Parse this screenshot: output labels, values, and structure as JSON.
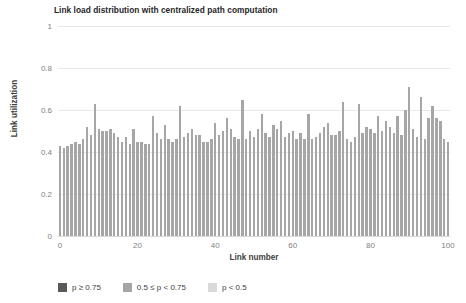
{
  "chart_data": {
    "type": "bar",
    "title": "Link load distribution with centralized path computation",
    "xlabel": "Link number",
    "ylabel": "Link utilization",
    "xlim": [
      0,
      101
    ],
    "ylim": [
      0,
      1
    ],
    "grid": true,
    "legend_position": "bottom-left",
    "bar_color": "#a6a6a6",
    "x_ticks": [
      0,
      20,
      40,
      60,
      80,
      100
    ],
    "y_ticks": [
      0,
      0.2,
      0.4,
      0.6,
      0.8,
      1
    ],
    "y_tick_labels": [
      "0",
      "0.2",
      "0.4",
      "0.6",
      "0.8",
      "1"
    ],
    "x": [
      0,
      1,
      2,
      3,
      4,
      5,
      6,
      7,
      8,
      9,
      10,
      11,
      12,
      13,
      14,
      15,
      16,
      17,
      18,
      19,
      20,
      21,
      22,
      23,
      24,
      25,
      26,
      27,
      28,
      29,
      30,
      31,
      32,
      33,
      34,
      35,
      36,
      37,
      38,
      39,
      40,
      41,
      42,
      43,
      44,
      45,
      46,
      47,
      48,
      49,
      50,
      51,
      52,
      53,
      54,
      55,
      56,
      57,
      58,
      59,
      60,
      61,
      62,
      63,
      64,
      65,
      66,
      67,
      68,
      69,
      70,
      71,
      72,
      73,
      74,
      75,
      76,
      77,
      78,
      79,
      80,
      81,
      82,
      83,
      84,
      85,
      86,
      87,
      88,
      89,
      90,
      91,
      92,
      93,
      94,
      95,
      96,
      97,
      98,
      99,
      100
    ],
    "categories": [
      "0",
      "1",
      "2",
      "3",
      "4",
      "5",
      "6",
      "7",
      "8",
      "9",
      "10",
      "11",
      "12",
      "13",
      "14",
      "15",
      "16",
      "17",
      "18",
      "19",
      "20",
      "21",
      "22",
      "23",
      "24",
      "25",
      "26",
      "27",
      "28",
      "29",
      "30",
      "31",
      "32",
      "33",
      "34",
      "35",
      "36",
      "37",
      "38",
      "39",
      "40",
      "41",
      "42",
      "43",
      "44",
      "45",
      "46",
      "47",
      "48",
      "49",
      "50",
      "51",
      "52",
      "53",
      "54",
      "55",
      "56",
      "57",
      "58",
      "59",
      "60",
      "61",
      "62",
      "63",
      "64",
      "65",
      "66",
      "67",
      "68",
      "69",
      "70",
      "71",
      "72",
      "73",
      "74",
      "75",
      "76",
      "77",
      "78",
      "79",
      "80",
      "81",
      "82",
      "83",
      "84",
      "85",
      "86",
      "87",
      "88",
      "89",
      "90",
      "91",
      "92",
      "93",
      "94",
      "95",
      "96",
      "97",
      "98",
      "99",
      "100"
    ],
    "values": [
      0.43,
      0.42,
      0.43,
      0.44,
      0.45,
      0.44,
      0.46,
      0.52,
      0.48,
      0.63,
      0.51,
      0.5,
      0.5,
      0.51,
      0.49,
      0.47,
      0.45,
      0.47,
      0.44,
      0.51,
      0.45,
      0.45,
      0.44,
      0.44,
      0.57,
      0.49,
      0.46,
      0.53,
      0.46,
      0.45,
      0.46,
      0.62,
      0.47,
      0.49,
      0.51,
      0.48,
      0.48,
      0.45,
      0.45,
      0.46,
      0.54,
      0.48,
      0.5,
      0.56,
      0.51,
      0.47,
      0.46,
      0.65,
      0.46,
      0.5,
      0.47,
      0.51,
      0.58,
      0.49,
      0.47,
      0.53,
      0.51,
      0.55,
      0.47,
      0.49,
      0.5,
      0.46,
      0.49,
      0.46,
      0.58,
      0.46,
      0.47,
      0.49,
      0.52,
      0.54,
      0.48,
      0.48,
      0.5,
      0.64,
      0.46,
      0.45,
      0.47,
      0.63,
      0.49,
      0.52,
      0.51,
      0.49,
      0.57,
      0.5,
      0.55,
      0.52,
      0.49,
      0.57,
      0.48,
      0.6,
      0.71,
      0.51,
      0.47,
      0.66,
      0.46,
      0.56,
      0.62,
      0.56,
      0.55,
      0.46,
      0.45
    ],
    "legend": [
      {
        "label": "p ≥ 0.75",
        "color": "#595959"
      },
      {
        "label": "0.5 ≤ p < 0.75",
        "color": "#a6a6a6"
      },
      {
        "label": "p < 0.5",
        "color": "#d9d9d9"
      }
    ]
  }
}
